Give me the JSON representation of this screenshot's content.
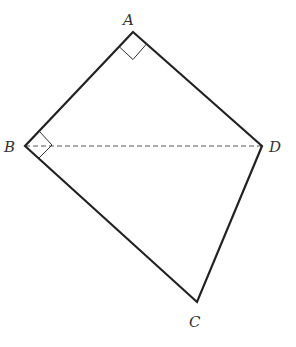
{
  "diagram": {
    "vertices": {
      "A": {
        "label": "A",
        "x": 133,
        "y": 32
      },
      "B": {
        "label": "B",
        "x": 25,
        "y": 146
      },
      "C": {
        "label": "C",
        "x": 197,
        "y": 302
      },
      "D": {
        "label": "D",
        "x": 262,
        "y": 146
      }
    },
    "edges": [
      "AB",
      "AD",
      "BC",
      "CD"
    ],
    "dashed_segments": [
      "BD"
    ],
    "right_angle_marks": [
      "A",
      "B"
    ],
    "colors": {
      "stroke": "#222222",
      "dashed": "#555555",
      "label": "#333333"
    }
  }
}
